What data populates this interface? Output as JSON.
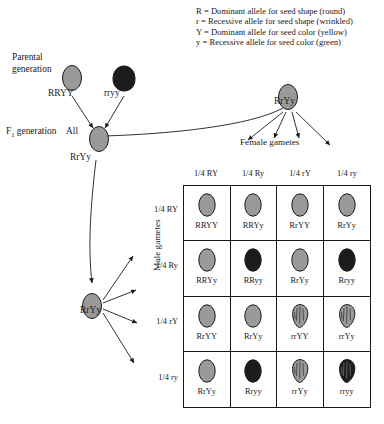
{
  "legend": {
    "lines": [
      "R = Dominant allele for seed shape (round)",
      "r = Recessive allele for seed shape (wrinkled)",
      "Y = Dominant allele for seed color (yellow)",
      "y = Recessive allele for seed color (green)"
    ]
  },
  "parental": {
    "label_line1": "Parental",
    "label_line2": "generation",
    "parent1_genotype": "RRYY",
    "parent2_genotype": "rryy",
    "parent1_phenotype": "round-yellow",
    "parent2_phenotype": "wrinkled-green"
  },
  "f1": {
    "label": "F₁ generation",
    "all_text": "All",
    "genotype": "RrYy"
  },
  "male_parent": {
    "genotype": "RrYy",
    "axis_label": "Male gametes",
    "gametes": [
      "1/4 RY",
      "1/4 Ry",
      "1/4 rY",
      "1/4 ry"
    ]
  },
  "female_parent": {
    "genotype": "RrYy",
    "axis_label": "Female gametes",
    "gametes": [
      "1/4 RY",
      "1/4 Ry",
      "1/4 rY",
      "1/4 ry"
    ]
  },
  "colors": {
    "yellow_seed": "#9a9a9a",
    "green_seed": "#1c1c1c",
    "outline": "#1a1a1a",
    "background": "#ffffff"
  },
  "chart_data": {
    "type": "table",
    "xlabel": "Female gametes",
    "ylabel": "Male gametes",
    "categories": [
      "1/4 RY",
      "1/4 Ry",
      "1/4 rY",
      "1/4 ry"
    ],
    "row_categories": [
      "1/4 RY",
      "1/4 Ry",
      "1/4 rY",
      "1/4 ry"
    ],
    "cells": [
      [
        {
          "genotype": "RRYY",
          "shape": "round",
          "color": "yellow"
        },
        {
          "genotype": "RRYy",
          "shape": "round",
          "color": "yellow"
        },
        {
          "genotype": "RrYY",
          "shape": "round",
          "color": "yellow"
        },
        {
          "genotype": "RrYy",
          "shape": "round",
          "color": "yellow"
        }
      ],
      [
        {
          "genotype": "RRYy",
          "shape": "round",
          "color": "yellow"
        },
        {
          "genotype": "RRyy",
          "shape": "round",
          "color": "green"
        },
        {
          "genotype": "RrYy",
          "shape": "round",
          "color": "yellow"
        },
        {
          "genotype": "Rryy",
          "shape": "round",
          "color": "green"
        }
      ],
      [
        {
          "genotype": "RrYY",
          "shape": "round",
          "color": "yellow"
        },
        {
          "genotype": "RrYy",
          "shape": "round",
          "color": "yellow"
        },
        {
          "genotype": "rrYY",
          "shape": "wrinkled",
          "color": "yellow"
        },
        {
          "genotype": "rrYy",
          "shape": "wrinkled",
          "color": "yellow"
        }
      ],
      [
        {
          "genotype": "RrYy",
          "shape": "round",
          "color": "yellow"
        },
        {
          "genotype": "Rryy",
          "shape": "round",
          "color": "green"
        },
        {
          "genotype": "rrYy",
          "shape": "wrinkled",
          "color": "yellow"
        },
        {
          "genotype": "rryy",
          "shape": "wrinkled",
          "color": "green"
        }
      ]
    ],
    "phenotype_ratio": "9 round-yellow : 3 round-green : 3 wrinkled-yellow : 1 wrinkled-green"
  }
}
